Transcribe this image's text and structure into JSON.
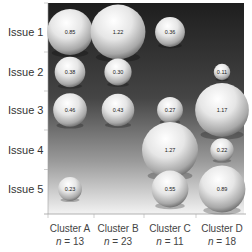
{
  "chart_data": {
    "type": "bubble",
    "title": "",
    "xlabel": "",
    "ylabel": "",
    "rows": [
      "Issue 1",
      "Issue 2",
      "Issue 3",
      "Issue 4",
      "Issue 5"
    ],
    "columns": [
      {
        "name": "Cluster A",
        "n_label": "n",
        "n": 13
      },
      {
        "name": "Cluster B",
        "n_label": "n",
        "n": 23
      },
      {
        "name": "Cluster C",
        "n_label": "n",
        "n": 11
      },
      {
        "name": "Cluster D",
        "n_label": "n",
        "n": 18
      }
    ],
    "values": [
      [
        0.85,
        1.22,
        0.36,
        null
      ],
      [
        0.38,
        0.3,
        null,
        0.11
      ],
      [
        0.46,
        0.43,
        0.27,
        1.17
      ],
      [
        null,
        null,
        1.27,
        0.22
      ],
      [
        0.23,
        null,
        0.55,
        0.89
      ]
    ],
    "value_labels": [
      [
        "0.85",
        "1.22",
        "0.36",
        null
      ],
      [
        "0.38",
        "0.30",
        null,
        "0.11"
      ],
      [
        "0.46",
        "0.43",
        "0.27",
        "1.17"
      ],
      [
        null,
        null,
        "1.27",
        "0.22"
      ],
      [
        "0.23",
        null,
        "0.55",
        "0.89"
      ]
    ],
    "grid": false,
    "legend": "none",
    "background": "vertical gradient dark-to-light"
  },
  "colors": {
    "plot_top": "#1f1f1f",
    "plot_mid": "#5a5a5a",
    "plot_bottom": "#f2f2f2",
    "bubble_highlight": "#ffffff",
    "bubble_shadow": "#6e6e6e",
    "axis": "#999999"
  }
}
